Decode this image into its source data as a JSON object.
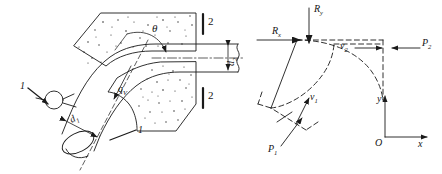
{
  "figure": {
    "panels": [
      {
        "id": "left",
        "name": "pipe-bend-assembly",
        "description": "Bent pipe embedded in a stippled concrete anchor block, section lines 1-1 and 2-2"
      },
      {
        "id": "right",
        "name": "control-volume-diagram",
        "description": "Dashed control volume of the bend with pressure, velocity and reaction force vectors"
      }
    ]
  },
  "left_panel": {
    "labels": {
      "angle": "θ",
      "flow_rate": "q",
      "flow_rate_sub": "V",
      "inlet_diameter": "d",
      "inlet_diameter_sub": "1",
      "outlet_diameter": "d",
      "outlet_diameter_sub": "2",
      "section_1_left": "1",
      "section_1_right": "1",
      "section_2_top": "2",
      "section_2_bottom": "2"
    },
    "elements": {
      "concrete_block": "concrete-anchor-block",
      "pipe": "bent-pipe",
      "valve": "valve-circle",
      "centerline": "pipe-centerline"
    }
  },
  "right_panel": {
    "labels": {
      "reaction_x": "R",
      "reaction_x_sub": "x",
      "reaction_y": "R",
      "reaction_y_sub": "y",
      "pressure_1": "P",
      "pressure_1_sub": "1",
      "pressure_2": "P",
      "pressure_2_sub": "2",
      "velocity_1": "v",
      "velocity_1_sub": "1",
      "velocity_2": "v",
      "velocity_2_sub": "2",
      "axis_x": "x",
      "axis_y": "y",
      "origin": "O"
    },
    "elements": {
      "control_volume": "dashed-control-volume",
      "axes": "coordinate-axes"
    }
  },
  "style": {
    "line_color": "#1a1a1a",
    "background": "#ffffff",
    "stipple_color": "#2b2b2b"
  }
}
